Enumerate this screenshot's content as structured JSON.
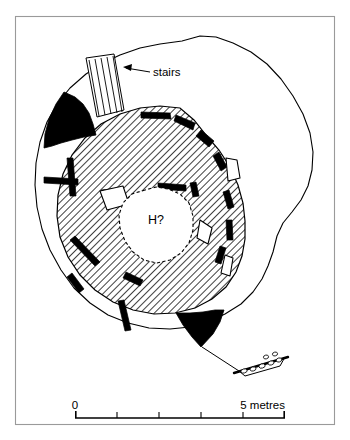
{
  "figure": {
    "type": "archaeological-site-plan",
    "background_color": "#ffffff",
    "ink_color": "#000000",
    "frame_color": "#9a9a9a"
  },
  "labels": {
    "stairs": "stairs",
    "hearth": "H?"
  },
  "scale_bar": {
    "start_label": "0",
    "end_label": "5 metres",
    "segments": 5,
    "total_metres": 5,
    "unit": "metres",
    "x_start_px": 75,
    "x_end_px": 285,
    "y_px": 418
  },
  "legend_keys": [
    {
      "name": "hatched-interior",
      "meaning": "interior floor / occupation deposit",
      "fill": "diagonal-hatch"
    },
    {
      "name": "solid-black",
      "meaning": "surviving stone walling",
      "fill": "#000000"
    },
    {
      "name": "white-outline",
      "meaning": "displaced or upright slab",
      "fill": "#ffffff"
    },
    {
      "name": "dashed-outline",
      "meaning": "conjectured hearth edge",
      "fill": "#ffffff"
    }
  ],
  "features": {
    "mound_outline": "M 200 36 L 182 41 L 160 44 L 140 48 L 120 55 L 103 63 L 86 74 L 70 88 L 57 104 L 47 122 L 40 142 L 36 163 L 35 185 L 37 207 L 42 229 L 50 250 L 61 270 L 74 288 L 90 303 L 108 315 L 128 323 L 149 328 L 170 329 L 190 327 L 208 322 L 225 314 L 241 304 L 253 292 L 262 279 L 268 266 L 273 252 L 277 236 L 283 223 L 292 212 L 301 200 L 308 186 L 312 170 L 313 152 L 310 133 L 303 114 L 293 96 L 281 79 L 267 64 L 251 52 L 233 43 L 216 37 Z",
    "interior_outline": "M 180 108 L 160 106 L 140 108 L 120 114 L 101 124 L 85 138 L 72 155 L 63 174 L 58 195 L 57 216 L 60 237 L 68 257 L 80 275 L 95 290 L 113 302 L 133 310 L 154 314 L 175 313 L 195 308 L 212 299 L 226 287 L 236 272 L 242 256 L 245 239 L 245 221 L 243 203 L 238 185 L 230 167 L 219 150 L 206 135 L 194 120 Z",
    "hearth_outline": "M 145 190 L 132 194 L 123 203 L 119 215 L 120 228 L 125 241 L 133 252 L 144 260 L 157 263 L 170 260 L 181 253 L 189 243 L 193 230 L 193 216 L 189 203 L 180 194 L 168 189 L 156 187 Z",
    "black_masses": [
      "M 64 92 L 56 104 L 49 119 L 45 134 L 44 148 L 52 146 L 61 143 L 72 140 L 84 137 L 96 135 L 93 124 L 89 113 L 83 104 L 75 97 Z",
      "M 176 313 L 183 325 L 192 337 L 201 347 L 213 334 L 220 322 L 224 310 L 215 310 L 203 312 L 190 313 Z"
    ],
    "wall_segments": [
      "M 141 112 L 170 113 L 171 119 L 141 118 Z",
      "M 176 115 L 195 123 L 193 130 L 174 121 Z",
      "M 201 130 L 214 141 L 209 147 L 196 136 Z",
      "M 219 152 L 227 167 L 221 171 L 213 156 Z",
      "M 229 190 L 234 207 L 228 209 L 223 192 Z",
      "M 232 220 L 233 240 L 227 240 L 226 220 Z",
      "M 226 248 L 221 264 L 215 262 L 220 246 Z",
      "M 196 182 L 199 196 L 193 197 L 190 183 Z",
      "M 158 183 L 186 185 L 186 191 L 158 189 Z",
      "M 166 214 L 192 222 L 190 228 L 164 220 Z",
      "M 44 177 L 78 179 L 78 185 L 44 183 Z",
      "M 73 158 L 76 196 L 70 196 L 67 158 Z",
      "M 101 190 L 123 188 L 124 194 L 102 196 Z",
      "M 75 236 L 100 262 L 95 266 L 70 240 Z",
      "M 72 273 L 84 289 L 79 293 L 67 277 Z",
      "M 126 272 L 143 280 L 140 286 L 123 278 Z",
      "M 124 300 L 131 330 L 125 331 L 118 301 Z",
      "M 168 236 L 181 245 L 177 251 L 164 242 Z"
    ],
    "white_blocks": [
      "M 100 191 L 123 186 L 129 204 L 107 210 Z",
      "M 226 158 L 237 160 L 240 178 L 228 181 Z",
      "M 200 220 L 212 228 L 208 244 L 197 238 Z",
      "M 225 255 L 233 258 L 230 276 L 221 273 Z"
    ],
    "stairs_block": "M 86 58 L 114 54 L 124 110 L 97 117 Z",
    "stair_treads": [
      "M 89 60 L 99 116",
      "M 95 59 L 105 115",
      "M 101 58 L 111 114",
      "M 107 57 L 117 113",
      "M 113 56 L 122 112"
    ],
    "passage_outline": "M 202 347 L 239 371 L 245 376 L 280 366 L 285 357",
    "rubble_line": "M 234 373 L 288 357",
    "arrow_leader": "M 150 72 L 126 68",
    "arrow_tip": "M 123 67 L 132 64 L 131 71 Z"
  }
}
